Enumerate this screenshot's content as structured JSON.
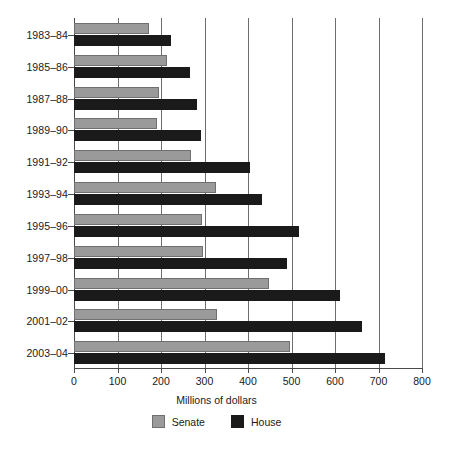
{
  "chart_data": {
    "type": "bar",
    "orientation": "horizontal",
    "title": "",
    "xlabel": "Millions of dollars",
    "ylabel": "",
    "xlim": [
      0,
      800
    ],
    "xticks": [
      0,
      100,
      200,
      300,
      400,
      500,
      600,
      700,
      800
    ],
    "xtick_labels": [
      "0",
      "100",
      "200",
      "300",
      "400",
      "500",
      "600",
      "700",
      "800"
    ],
    "grid": true,
    "grid_axis": "x",
    "legend_position": "bottom",
    "categories": [
      "1983–84",
      "1985–86",
      "1987–88",
      "1989–90",
      "1991–92",
      "1993–94",
      "1995–96",
      "1997–98",
      "1999–00",
      "2001–02",
      "2003–04"
    ],
    "series": [
      {
        "name": "Senate",
        "color": "#9a9a9a",
        "values": [
          172,
          214,
          195,
          191,
          269,
          327,
          294,
          297,
          448,
          328,
          497
        ]
      },
      {
        "name": "House",
        "color": "#1a1a1a",
        "values": [
          223,
          267,
          283,
          292,
          405,
          432,
          517,
          490,
          611,
          662,
          716
        ]
      }
    ]
  },
  "legend": {
    "items": [
      {
        "label": "Senate",
        "swatch": "senate"
      },
      {
        "label": "House",
        "swatch": "house"
      }
    ]
  }
}
